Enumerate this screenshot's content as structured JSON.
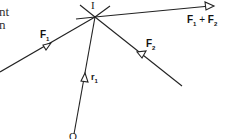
{
  "diagram": {
    "text_fragments": [
      "nt",
      "n"
    ],
    "points": {
      "I": {
        "label": "I",
        "x": 95,
        "y": 17
      },
      "O": {
        "label": "O",
        "x": 74,
        "y": 137
      }
    },
    "vectors": {
      "F1": {
        "label": "F",
        "sub": "1"
      },
      "F2": {
        "label": "F",
        "sub": "2"
      },
      "sum": {
        "label_a": "F",
        "sub_a": "1",
        "plus": "+",
        "label_b": "F",
        "sub_b": "2"
      },
      "r1": {
        "label": "r",
        "sub": "1"
      }
    },
    "colors": {
      "line": "#222222",
      "background": "#ffffff"
    }
  }
}
